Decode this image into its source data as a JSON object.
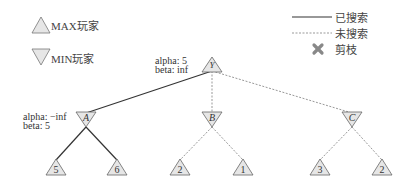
{
  "legend": {
    "max_player": "MAX玩家",
    "min_player": "MIN玩家",
    "searched": "已搜索",
    "unsearched": "未搜索",
    "pruned": "剪枝",
    "pruned_icon": "x-mark-icon"
  },
  "colors": {
    "node_fill": "#e6e6e6",
    "node_stroke": "#666666",
    "searched_edge": "#333333",
    "unsearched_edge": "#999999",
    "prune_mark": "#888888"
  },
  "tree": {
    "root": {
      "id": "Y",
      "type": "MAX",
      "alpha": "alpha: 5",
      "beta": "beta: inf"
    },
    "level1": [
      {
        "id": "A",
        "type": "MIN",
        "alpha": "alpha: −inf",
        "beta": "beta: 5",
        "edge": "searched"
      },
      {
        "id": "B",
        "type": "MIN",
        "edge": "unsearched"
      },
      {
        "id": "C",
        "type": "MIN",
        "edge": "unsearched"
      }
    ],
    "leaves": [
      {
        "parent": "A",
        "value": "5",
        "edge": "searched"
      },
      {
        "parent": "A",
        "value": "6",
        "edge": "searched"
      },
      {
        "parent": "B",
        "value": "2",
        "edge": "unsearched"
      },
      {
        "parent": "B",
        "value": "1",
        "edge": "unsearched"
      },
      {
        "parent": "C",
        "value": "3",
        "edge": "unsearched"
      },
      {
        "parent": "C",
        "value": "2",
        "edge": "unsearched"
      }
    ]
  }
}
